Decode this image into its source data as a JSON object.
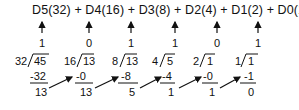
{
  "equation": {
    "text": "D5(32) + D4(16) + D3(8) + D2(4) + D1(2) + D0(1) = 45",
    "terms": [
      "D5(32)",
      "D4(16)",
      "D3(8)",
      "D2(4)",
      "D1(2)",
      "D0(1)"
    ],
    "result": "45"
  },
  "columns": [
    {
      "bit": "D5",
      "quotient": "1",
      "divisor": "32",
      "dividend": "45",
      "subtract": "-32",
      "remainder": "13"
    },
    {
      "bit": "D4",
      "quotient": "0",
      "divisor": "16",
      "dividend": "13",
      "subtract": "-0",
      "remainder": "13"
    },
    {
      "bit": "D3",
      "quotient": "1",
      "divisor": "8",
      "dividend": "13",
      "subtract": "-8",
      "remainder": "5"
    },
    {
      "bit": "D2",
      "quotient": "1",
      "divisor": "4",
      "dividend": "5",
      "subtract": "-4",
      "remainder": "1"
    },
    {
      "bit": "D1",
      "quotient": "0",
      "divisor": "2",
      "dividend": "1",
      "subtract": "-0",
      "remainder": "1"
    },
    {
      "bit": "D0",
      "quotient": "1",
      "divisor": "1",
      "dividend": "1",
      "subtract": "-1",
      "remainder": "0"
    }
  ]
}
